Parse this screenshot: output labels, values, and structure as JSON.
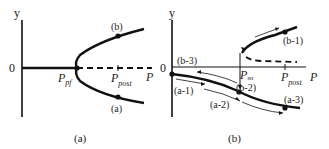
{
  "panels": [
    {
      "id": "a",
      "caption": "(a)",
      "y_axis_label": "y",
      "origin_label": "0",
      "x_axis_label": "P",
      "bifurcation_point": {
        "label": "P",
        "sub": "pf"
      },
      "marker": {
        "label": "P",
        "sub": "post"
      },
      "branch_labels": [
        "(b)",
        "(a)"
      ]
    },
    {
      "id": "b",
      "caption": "(b)",
      "y_axis_label": "y",
      "origin_label": "0",
      "x_axis_label": "P",
      "bifurcation_point": {
        "label": "P",
        "sub": "sn"
      },
      "marker": {
        "label": "P",
        "sub": "post"
      },
      "path_labels": [
        "(b-3)",
        "(b-1)",
        "(b-2)",
        "(a-1)",
        "(a-2)",
        "(a-3)"
      ]
    }
  ],
  "colors": {
    "line": "#111111",
    "text": "#222222",
    "background": "#ffffff"
  }
}
